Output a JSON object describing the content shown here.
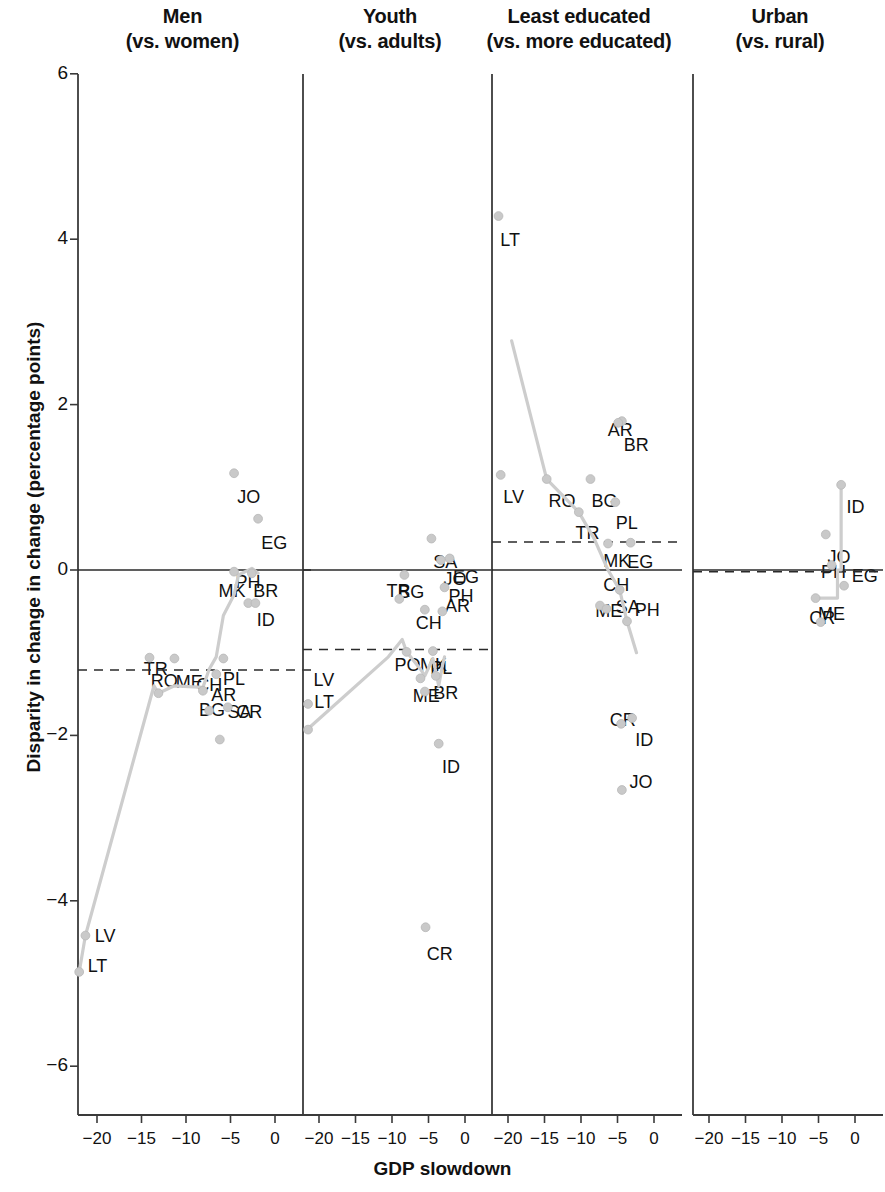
{
  "figure": {
    "ylabel": "Disparity in change in change (percentage points)",
    "xlabel": "GDP slowdown",
    "point_color": "#c9c9c9",
    "line_color": "#cdcdcd",
    "axis_color": "#3a3a3a"
  },
  "chart_data": {
    "type": "scatter",
    "title": "",
    "xlabel": "GDP slowdown",
    "ylabel": "Disparity in change in change (percentage points)",
    "xlim": [
      -23.5,
      1.5
    ],
    "ylim": [
      -6.6,
      6.2
    ],
    "xticks": [
      -20,
      -15,
      -10,
      -5,
      0
    ],
    "xtick_labels": [
      "−20",
      "−15",
      "−10",
      "−5",
      "0"
    ],
    "yticks": [
      6,
      4,
      2,
      0,
      -2,
      -4,
      -6
    ],
    "ytick_labels": [
      "6",
      "4",
      "2",
      "0",
      "−2",
      "−4",
      "−6"
    ],
    "grid": false,
    "legend": null,
    "panels": [
      {
        "title_line1": "Men",
        "title_line2": "(vs. women)",
        "zero_line": 0,
        "mean_line": -1.21,
        "points": [
          {
            "code": "JO",
            "x": -4.6,
            "y": 1.17,
            "lx": -0.1,
            "ly": -0.3
          },
          {
            "code": "EG",
            "x": -1.9,
            "y": 0.62,
            "lx": -0.1,
            "ly": -0.3
          },
          {
            "code": "MK",
            "x": -4.6,
            "y": -0.02,
            "lx": -2.2,
            "ly": -0.24
          },
          {
            "code": "BR",
            "x": -2.6,
            "y": -0.04,
            "lx": -0.3,
            "ly": -0.22
          },
          {
            "code": "PH",
            "x": -3.0,
            "y": -0.4,
            "lx": -1.9,
            "ly": 0.24
          },
          {
            "code": "ID",
            "x": -2.2,
            "y": -0.4,
            "lx": -0.3,
            "ly": -0.22
          },
          {
            "code": "RO",
            "x": -14.1,
            "y": -1.06,
            "lx": -0.3,
            "ly": -0.3
          },
          {
            "code": "ME",
            "x": -11.3,
            "y": -1.07,
            "lx": -0.3,
            "ly": -0.3
          },
          {
            "code": "PL",
            "x": -5.8,
            "y": -1.07,
            "lx": -0.5,
            "ly": -0.26
          },
          {
            "code": "AR",
            "x": -6.6,
            "y": -1.26,
            "lx": -1.0,
            "ly": -0.26
          },
          {
            "code": "BG",
            "x": -8.1,
            "y": -1.46,
            "lx": -0.9,
            "ly": -0.24
          },
          {
            "code": "TR",
            "x": -13.1,
            "y": -1.49,
            "lx": -2.1,
            "ly": 0.28
          },
          {
            "code": "CH",
            "x": -7.4,
            "y": -1.7,
            "lx": -1.9,
            "ly": 0.3
          },
          {
            "code": "CR",
            "x": -5.3,
            "y": -1.66,
            "lx": 0.5,
            "ly": -0.07
          },
          {
            "code": "SA",
            "x": -6.2,
            "y": -2.05,
            "lx": 0.4,
            "ly": 0.32
          },
          {
            "code": "LV",
            "x": -21.3,
            "y": -4.42,
            "lx": 0.6,
            "ly": -0.02
          },
          {
            "code": "LT",
            "x": -22.0,
            "y": -4.86,
            "lx": 0.5,
            "ly": 0.06
          }
        ],
        "fit": [
          [
            -22.0,
            -4.86
          ],
          [
            -21.3,
            -4.42
          ],
          [
            -13.6,
            -1.4
          ],
          [
            -13.1,
            -1.49
          ],
          [
            -11.3,
            -1.4
          ],
          [
            -8.1,
            -1.42
          ],
          [
            -7.4,
            -1.2
          ],
          [
            -6.6,
            -1.05
          ],
          [
            -5.8,
            -0.55
          ],
          [
            -4.6,
            -0.3
          ],
          [
            -4.1,
            -0.06
          ],
          [
            -2.6,
            0.02
          ],
          [
            -1.9,
            -0.04
          ]
        ]
      },
      {
        "title_line1": "Youth",
        "title_line2": "(vs. adults)",
        "zero_line": 0,
        "mean_line": -0.96,
        "points": [
          {
            "code": "SA",
            "x": -4.6,
            "y": 0.38,
            "lx": -0.3,
            "ly": -0.3
          },
          {
            "code": "JO",
            "x": -3.3,
            "y": 0.12,
            "lx": -0.2,
            "ly": -0.24
          },
          {
            "code": "EG",
            "x": -2.1,
            "y": 0.14,
            "lx": -0.1,
            "ly": -0.24
          },
          {
            "code": "BG",
            "x": -8.3,
            "y": -0.06,
            "lx": -1.4,
            "ly": -0.22
          },
          {
            "code": "AR",
            "x": -2.8,
            "y": -0.21,
            "lx": -0.5,
            "ly": -0.24
          },
          {
            "code": "TR",
            "x": -9.0,
            "y": -0.35,
            "lx": -2.3,
            "ly": 0.09
          },
          {
            "code": "CH",
            "x": -5.5,
            "y": -0.48,
            "lx": -1.8,
            "ly": -0.17
          },
          {
            "code": "PH",
            "x": -3.1,
            "y": -0.5,
            "lx": 0.3,
            "ly": 0.17
          },
          {
            "code": "PO",
            "x": -8.0,
            "y": -0.99,
            "lx": -2.2,
            "ly": -0.17
          },
          {
            "code": "PL",
            "x": -4.4,
            "y": -0.98,
            "lx": -0.9,
            "ly": -0.22
          },
          {
            "code": "ME",
            "x": -6.1,
            "y": -1.31,
            "lx": -1.6,
            "ly": -0.22
          },
          {
            "code": "BR",
            "x": -4.0,
            "y": -1.28,
            "lx": -0.9,
            "ly": -0.22
          },
          {
            "code": "MK",
            "x": -5.5,
            "y": -1.47,
            "lx": -1.2,
            "ly": 0.31
          },
          {
            "code": "LV",
            "x": -21.5,
            "y": -1.62,
            "lx": 0.2,
            "ly": 0.28
          },
          {
            "code": "LT",
            "x": -21.5,
            "y": -1.93,
            "lx": 0.3,
            "ly": 0.32
          },
          {
            "code": "ID",
            "x": -3.6,
            "y": -2.1,
            "lx": -0.1,
            "ly": -0.3
          },
          {
            "code": "CR",
            "x": -5.4,
            "y": -4.32,
            "lx": -0.4,
            "ly": -0.34
          }
        ],
        "fit": [
          [
            -21.5,
            -1.92
          ],
          [
            -10.5,
            -1.05
          ],
          [
            -8.6,
            -0.84
          ],
          [
            -8.0,
            -0.99
          ],
          [
            -6.1,
            -1.2
          ],
          [
            -5.5,
            -1.28
          ],
          [
            -4.4,
            -1.07
          ],
          [
            -4.0,
            -1.23
          ],
          [
            -3.6,
            -1.4
          ],
          [
            -3.1,
            -1.16
          ],
          [
            -2.8,
            -1.05
          ]
        ]
      },
      {
        "title_line1": "Least educated",
        "title_line2": "(vs. more educated)",
        "zero_line": 0,
        "mean_line": 0.34,
        "points": [
          {
            "code": "LT",
            "x": -21.3,
            "y": 4.28,
            "lx": -0.3,
            "ly": -0.3
          },
          {
            "code": "BR",
            "x": -4.4,
            "y": 1.8,
            "lx": -0.3,
            "ly": -0.3
          },
          {
            "code": "AR",
            "x": -4.9,
            "y": 1.78,
            "lx": -2.0,
            "ly": -0.1
          },
          {
            "code": "LV",
            "x": -21.0,
            "y": 1.15,
            "lx": -0.2,
            "ly": -0.28
          },
          {
            "code": "RO",
            "x": -14.7,
            "y": 1.1,
            "lx": -0.3,
            "ly": -0.28
          },
          {
            "code": "BG",
            "x": -8.7,
            "y": 1.1,
            "lx": -0.4,
            "ly": -0.28
          },
          {
            "code": "PL",
            "x": -5.3,
            "y": 0.82,
            "lx": -0.5,
            "ly": -0.26
          },
          {
            "code": "TR",
            "x": -10.3,
            "y": 0.7,
            "lx": -1.0,
            "ly": -0.26
          },
          {
            "code": "MK",
            "x": -6.3,
            "y": 0.32,
            "lx": -1.2,
            "ly": -0.22
          },
          {
            "code": "EG",
            "x": -3.2,
            "y": 0.33,
            "lx": -1.0,
            "ly": -0.24
          },
          {
            "code": "SA",
            "x": -4.7,
            "y": -0.24,
            "lx": -1.1,
            "ly": -0.22
          },
          {
            "code": "ME",
            "x": -7.4,
            "y": -0.43,
            "lx": -1.2,
            "ly": -0.08
          },
          {
            "code": "CH",
            "x": -6.5,
            "y": -0.47,
            "lx": -1.0,
            "ly": 0.28
          },
          {
            "code": "PH",
            "x": -3.7,
            "y": -0.62,
            "lx": 0.5,
            "ly": 0.12
          },
          {
            "code": "ID",
            "x": -3.0,
            "y": -1.79,
            "lx": -0.1,
            "ly": -0.28
          },
          {
            "code": "CR",
            "x": -4.5,
            "y": -1.86,
            "lx": -2.1,
            "ly": 0.04
          },
          {
            "code": "JO",
            "x": -4.4,
            "y": -2.66,
            "lx": 0.5,
            "ly": 0.08
          }
        ],
        "fit": [
          [
            -19.5,
            2.77
          ],
          [
            -14.7,
            1.1
          ],
          [
            -10.3,
            0.7
          ],
          [
            -8.2,
            0.38
          ],
          [
            -6.3,
            0.0
          ],
          [
            -4.7,
            -0.24
          ],
          [
            -3.7,
            -0.62
          ],
          [
            -2.4,
            -1.0
          ]
        ]
      },
      {
        "title_line1": "Urban",
        "title_line2": "(vs. rural)",
        "zero_line": 0,
        "mean_line": -0.02,
        "points": [
          {
            "code": "ID",
            "x": -1.9,
            "y": 1.03,
            "lx": 0.2,
            "ly": -0.28
          },
          {
            "code": "JO",
            "x": -4.0,
            "y": 0.43,
            "lx": -0.3,
            "ly": -0.28
          },
          {
            "code": "PH",
            "x": -3.2,
            "y": 0.06,
            "lx": -2.0,
            "ly": -0.1
          },
          {
            "code": "EG",
            "x": -1.5,
            "y": -0.19,
            "lx": 0.5,
            "ly": 0.1
          },
          {
            "code": "ME",
            "x": -5.4,
            "y": -0.34,
            "lx": -0.2,
            "ly": -0.2
          },
          {
            "code": "CR",
            "x": -4.7,
            "y": -0.63,
            "lx": -2.1,
            "ly": 0.04
          }
        ],
        "fit": [
          [
            -5.4,
            -0.34
          ],
          [
            -2.4,
            -0.34
          ],
          [
            -2.4,
            0.0
          ],
          [
            -1.9,
            0.0
          ],
          [
            -1.9,
            1.03
          ]
        ]
      }
    ]
  }
}
